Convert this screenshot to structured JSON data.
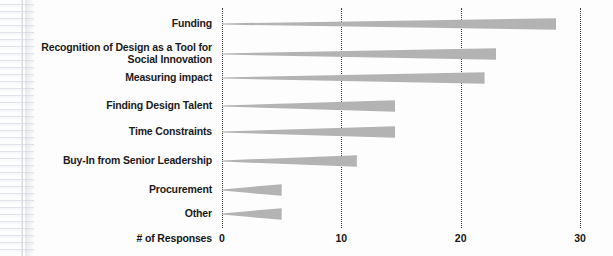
{
  "chart_data": {
    "type": "bar",
    "orientation": "horizontal",
    "title": "",
    "xlabel": "# of Responses",
    "ylabel": "",
    "xlim": [
      0,
      30
    ],
    "xticks": [
      0,
      10,
      20,
      30
    ],
    "xtick_labels": [
      "0",
      "10",
      "20",
      "30"
    ],
    "grid": "vertical-dotted",
    "legend": "none",
    "bar_style": "tapered-wedge",
    "bar_color": "#b3b3b3",
    "categories": [
      "Funding",
      "Recognition of Design as a Tool for\nSocial Innovation",
      "Measuring impact",
      "Finding Design Talent",
      "Time Constraints",
      "Buy-In from Senior Leadership",
      "Procurement",
      "Other"
    ],
    "values": [
      28,
      23,
      22,
      14.5,
      14.5,
      11.3,
      5,
      5
    ]
  },
  "axis": {
    "x_title": "# of Responses"
  },
  "colors": {
    "bar": "#b3b3b3",
    "bar_light": "#d6d6d6",
    "gridline": "#3a3a3a",
    "text": "#1b1b1b",
    "background": "#fdfdfd"
  }
}
